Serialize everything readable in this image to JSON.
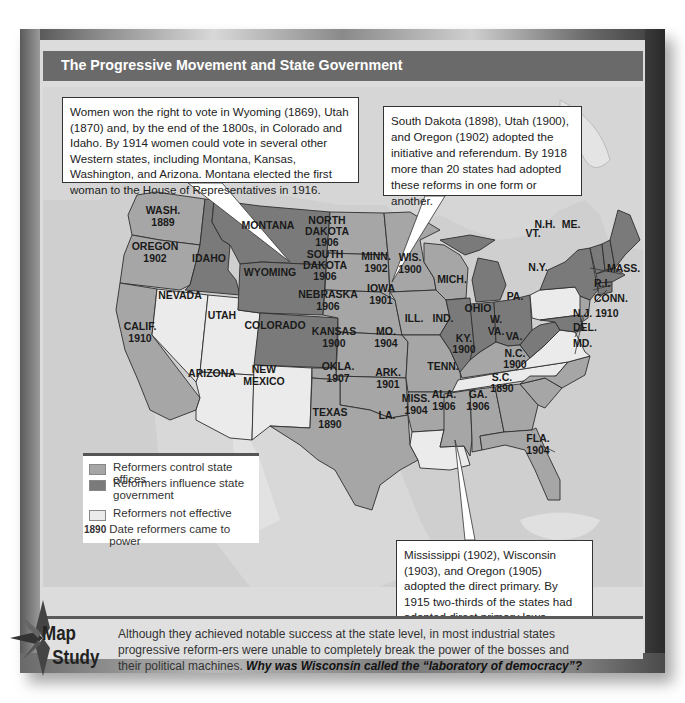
{
  "header": {
    "title": "The Progressive Movement and State Government"
  },
  "callouts": {
    "suffrage": "Women won the right to vote in Wyoming (1869), Utah (1870) and, by the end of the 1800s, in Colorado and Idaho. By 1914 women could vote in several other Western states, including Montana, Kansas, Washington, and Arizona. Montana elected the first woman to the House of Representatives in 1916.",
    "initiative": "South Dakota (1898), Utah (1900), and Oregon (1902) adopted the initiative and referendum. By 1918 more than 20 states had adopted these reforms in one form or another.",
    "primary": "Mississippi (1902), Wisconsin (1903), and Oregon (1905) adopted the direct primary. By 1915 two-thirds of the states had adopted direct primary laws."
  },
  "legend": {
    "items": [
      {
        "label": "Reformers control state offices",
        "color": "#a6a6a6"
      },
      {
        "label": "Reformers influence state government",
        "color": "#7a7a7a"
      },
      {
        "label": "Reformers not effective",
        "color": "#ebebeb"
      }
    ],
    "date_sample": "1890",
    "date_label": "Date reformers came to power"
  },
  "colors": {
    "control": "#a6a6a6",
    "influence": "#7a7a7a",
    "not_effective": "#ebebeb",
    "title_bar": "#6a6a6a"
  },
  "states": [
    {
      "name": "WASH.",
      "year": "1889",
      "category": "control"
    },
    {
      "name": "OREGON",
      "year": "1902",
      "category": "control"
    },
    {
      "name": "CALIF.",
      "year": "1910",
      "category": "control"
    },
    {
      "name": "IDAHO",
      "year": "",
      "category": "influence"
    },
    {
      "name": "NEVADA",
      "year": "",
      "category": "not_effective"
    },
    {
      "name": "UTAH",
      "year": "",
      "category": "not_effective"
    },
    {
      "name": "ARIZONA",
      "year": "",
      "category": "not_effective"
    },
    {
      "name": "MONTANA",
      "year": "",
      "category": "influence"
    },
    {
      "name": "WYOMING",
      "year": "",
      "category": "influence"
    },
    {
      "name": "COLORADO",
      "year": "",
      "category": "influence"
    },
    {
      "name": "NEW MEXICO",
      "year": "",
      "category": "not_effective"
    },
    {
      "name": "NORTH DAKOTA",
      "year": "1906",
      "category": "control"
    },
    {
      "name": "SOUTH DAKOTA",
      "year": "1906",
      "category": "control"
    },
    {
      "name": "NEBRASKA",
      "year": "1906",
      "category": "control"
    },
    {
      "name": "KANSAS",
      "year": "1900",
      "category": "control"
    },
    {
      "name": "OKLA.",
      "year": "1907",
      "category": "control"
    },
    {
      "name": "TEXAS",
      "year": "1890",
      "category": "control"
    },
    {
      "name": "MINN.",
      "year": "1902",
      "category": "control"
    },
    {
      "name": "IOWA",
      "year": "1901",
      "category": "control"
    },
    {
      "name": "MO.",
      "year": "1904",
      "category": "control"
    },
    {
      "name": "ARK.",
      "year": "1901",
      "category": "control"
    },
    {
      "name": "LA.",
      "year": "",
      "category": "not_effective"
    },
    {
      "name": "WIS.",
      "year": "1900",
      "category": "control"
    },
    {
      "name": "ILL.",
      "year": "",
      "category": "influence"
    },
    {
      "name": "MICH.",
      "year": "",
      "category": "influence"
    },
    {
      "name": "IND.",
      "year": "",
      "category": "influence"
    },
    {
      "name": "OHIO",
      "year": "",
      "category": "influence"
    },
    {
      "name": "KY.",
      "year": "1900",
      "category": "control"
    },
    {
      "name": "TENN.",
      "year": "",
      "category": "not_effective"
    },
    {
      "name": "MISS.",
      "year": "1904",
      "category": "control"
    },
    {
      "name": "ALA.",
      "year": "1906",
      "category": "control"
    },
    {
      "name": "GA.",
      "year": "1906",
      "category": "control"
    },
    {
      "name": "FLA.",
      "year": "1904",
      "category": "control"
    },
    {
      "name": "S.C.",
      "year": "1890",
      "category": "control"
    },
    {
      "name": "N.C.",
      "year": "1900",
      "category": "control"
    },
    {
      "name": "VA.",
      "year": "",
      "category": "not_effective"
    },
    {
      "name": "W. VA.",
      "year": "",
      "category": "influence"
    },
    {
      "name": "PA.",
      "year": "",
      "category": "not_effective"
    },
    {
      "name": "N.Y.",
      "year": "",
      "category": "influence"
    },
    {
      "name": "VT.",
      "year": "",
      "category": "influence"
    },
    {
      "name": "N.H.",
      "year": "",
      "category": "influence"
    },
    {
      "name": "ME.",
      "year": "",
      "category": "influence"
    },
    {
      "name": "MASS.",
      "year": "",
      "category": "influence"
    },
    {
      "name": "R.I.",
      "year": "",
      "category": "influence"
    },
    {
      "name": "CONN.",
      "year": "",
      "category": "influence"
    },
    {
      "name": "N.J.",
      "year": "1910",
      "category": "control"
    },
    {
      "name": "DEL.",
      "year": "",
      "category": "influence"
    },
    {
      "name": "MD.",
      "year": "",
      "category": "influence"
    }
  ],
  "map_labels": {
    "wash": "WASH.",
    "wash_y": "1889",
    "oregon": "OREGON",
    "oregon_y": "1902",
    "calif": "CALIF.",
    "calif_y": "1910",
    "idaho": "IDAHO",
    "nevada": "NEVADA",
    "utah": "UTAH",
    "arizona": "ARIZONA",
    "montana": "MONTANA",
    "wyoming": "WYOMING",
    "colorado": "COLORADO",
    "newmexico_1": "NEW",
    "newmexico_2": "MEXICO",
    "nd_1": "NORTH",
    "nd_2": "DAKOTA",
    "nd_y": "1906",
    "sd_1": "SOUTH",
    "sd_2": "DAKOTA",
    "sd_y": "1906",
    "nebraska": "NEBRASKA",
    "nebraska_y": "1906",
    "kansas": "KANSAS",
    "kansas_y": "1900",
    "okla": "OKLA.",
    "okla_y": "1907",
    "texas": "TEXAS",
    "texas_y": "1890",
    "minn": "MINN.",
    "minn_y": "1902",
    "iowa": "IOWA",
    "iowa_y": "1901",
    "mo": "MO.",
    "mo_y": "1904",
    "ark": "ARK.",
    "ark_y": "1901",
    "la": "LA.",
    "wis": "WIS.",
    "wis_y": "1900",
    "ill": "ILL.",
    "mich": "MICH.",
    "ind": "IND.",
    "ohio": "OHIO",
    "ky": "KY.",
    "ky_y": "1900",
    "tenn": "TENN.",
    "miss": "MISS.",
    "miss_y": "1904",
    "ala": "ALA.",
    "ala_y": "1906",
    "ga": "GA.",
    "ga_y": "1906",
    "fla": "FLA.",
    "fla_y": "1904",
    "sc": "S.C.",
    "sc_y": "1890",
    "nc": "N.C.",
    "nc_y": "1900",
    "va": "VA.",
    "wva_1": "W.",
    "wva_2": "VA.",
    "pa": "PA.",
    "ny": "N.Y.",
    "vt": "VT.",
    "nh": "N.H.",
    "me": "ME.",
    "mass": "MASS.",
    "ri": "R.I.",
    "conn": "CONN.",
    "nj": "N.J. 1910",
    "del": "DEL.",
    "md": "MD."
  },
  "map_study": {
    "badge_line1": "Map",
    "badge_line2": "Study",
    "text": "Although they achieved notable success at the state level, in most industrial states progressive reform-ers were unable to completely break the power of the bosses and their political machines.",
    "question": "Why was Wisconsin called the “laboratory of democracy”?"
  }
}
